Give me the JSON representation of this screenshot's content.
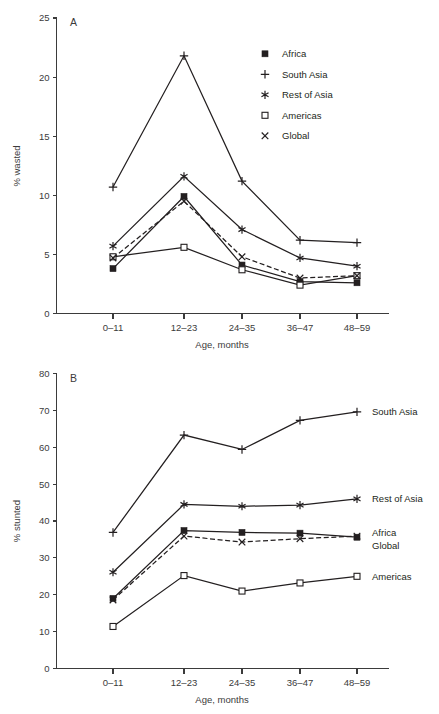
{
  "figure": {
    "background": "#ffffff",
    "ink_color": "#231f20",
    "axis_color": "#3b3b3b"
  },
  "chart_data": [
    {
      "type": "line",
      "panel": "A",
      "panel_letter": "A",
      "title": "",
      "xlabel": "Age, months",
      "ylabel": "% wasted",
      "categories": [
        "0–11",
        "12–23",
        "24–35",
        "36–47",
        "48–59"
      ],
      "ylim": [
        0,
        25
      ],
      "yticks": [
        0,
        5,
        10,
        15,
        20,
        25
      ],
      "ytick_labels": [
        "0",
        "5",
        "10",
        "15",
        "20",
        "25"
      ],
      "grid": false,
      "legend_position": "upper-right-inside",
      "series": [
        {
          "name": "Africa",
          "marker": "filled-square",
          "linestyle": "solid",
          "values": [
            3.8,
            9.9,
            4.1,
            2.7,
            2.6
          ]
        },
        {
          "name": "South Asia",
          "marker": "plus",
          "linestyle": "solid",
          "values": [
            10.7,
            21.8,
            11.2,
            6.2,
            6.0
          ]
        },
        {
          "name": "Rest of Asia",
          "marker": "asterisk",
          "linestyle": "solid",
          "values": [
            5.7,
            11.6,
            7.1,
            4.7,
            4.0
          ]
        },
        {
          "name": "Americas",
          "marker": "open-square",
          "linestyle": "solid",
          "values": [
            4.8,
            5.6,
            3.7,
            2.4,
            3.2
          ]
        },
        {
          "name": "Global",
          "marker": "cross",
          "linestyle": "dashed",
          "values": [
            4.7,
            9.5,
            4.8,
            3.0,
            3.2
          ]
        }
      ]
    },
    {
      "type": "line",
      "panel": "B",
      "panel_letter": "B",
      "title": "",
      "xlabel": "Age, months",
      "ylabel": "% stunted",
      "categories": [
        "0–11",
        "12–23",
        "24–35",
        "36–47",
        "48–59"
      ],
      "ylim": [
        0,
        80
      ],
      "yticks": [
        0,
        10,
        20,
        30,
        40,
        50,
        60,
        70,
        80
      ],
      "ytick_labels": [
        "0",
        "10",
        "20",
        "30",
        "40",
        "50",
        "60",
        "70",
        "80"
      ],
      "grid": false,
      "legend_position": "right-of-line-ends",
      "series": [
        {
          "name": "Africa",
          "marker": "filled-square",
          "linestyle": "solid",
          "values": [
            19.0,
            37.4,
            36.9,
            36.7,
            35.6
          ]
        },
        {
          "name": "South Asia",
          "marker": "plus",
          "linestyle": "solid",
          "values": [
            36.9,
            63.3,
            59.4,
            67.3,
            69.6
          ]
        },
        {
          "name": "Rest of Asia",
          "marker": "asterisk",
          "linestyle": "solid",
          "values": [
            26.1,
            44.5,
            44.0,
            44.3,
            46.0
          ]
        },
        {
          "name": "Americas",
          "marker": "open-square",
          "linestyle": "solid",
          "values": [
            11.4,
            25.2,
            21.0,
            23.2,
            25.0
          ]
        },
        {
          "name": "Global",
          "marker": "cross",
          "linestyle": "dashed",
          "values": [
            18.6,
            35.9,
            34.3,
            35.2,
            35.9
          ]
        }
      ]
    }
  ],
  "panel_a": {
    "letter": "A",
    "ylabel": "% wasted",
    "xlabel": "Age, months",
    "legend": {
      "items": [
        {
          "label": "Africa",
          "marker": "filled-square"
        },
        {
          "label": "South Asia",
          "marker": "plus"
        },
        {
          "label": "Rest of Asia",
          "marker": "asterisk"
        },
        {
          "label": "Americas",
          "marker": "open-square"
        },
        {
          "label": "Global",
          "marker": "cross"
        }
      ]
    }
  },
  "panel_b": {
    "letter": "B",
    "ylabel": "% stunted",
    "xlabel": "Age, months",
    "end_labels": [
      {
        "label": "South Asia",
        "marker": "plus"
      },
      {
        "label": "Rest of Asia",
        "marker": "asterisk"
      },
      {
        "label": "Africa",
        "marker": "filled-square"
      },
      {
        "label": "Global",
        "marker": "cross"
      },
      {
        "label": "Americas",
        "marker": "open-square"
      }
    ]
  }
}
